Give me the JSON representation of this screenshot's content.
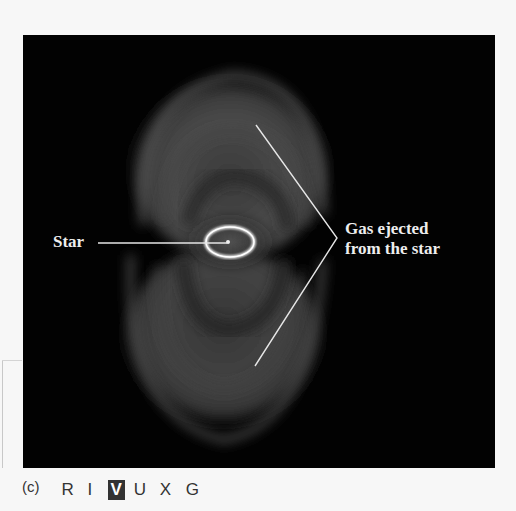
{
  "figure": {
    "panel_id": "(c)",
    "labels": {
      "star": "Star",
      "gas_line1": "Gas ejected",
      "gas_line2": "from the star"
    },
    "wavelength_bands": [
      {
        "label": "R",
        "active": false
      },
      {
        "label": "I",
        "active": false
      },
      {
        "label": "V",
        "active": true
      },
      {
        "label": "U",
        "active": false
      },
      {
        "label": "X",
        "active": false
      },
      {
        "label": "G",
        "active": false
      }
    ],
    "colors": {
      "background": "#020202",
      "pointer_lines": "#e6e6e6",
      "label_text": "#eeeeee",
      "active_band_bg": "#333333"
    }
  }
}
